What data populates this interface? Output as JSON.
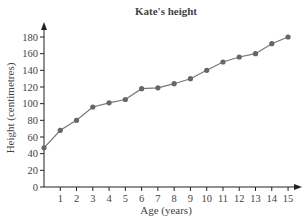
{
  "chart_data": {
    "type": "line",
    "title": "Kate's height",
    "xlabel": "Age (years)",
    "ylabel": "Height (centimetres)",
    "x": [
      0,
      1,
      2,
      3,
      4,
      5,
      6,
      7,
      8,
      9,
      10,
      11,
      12,
      13,
      14,
      15
    ],
    "series": [
      {
        "name": "Kate's height",
        "values": [
          47,
          68,
          80,
          96,
          101,
          105,
          118,
          119,
          124,
          130,
          140,
          150,
          156,
          160,
          172,
          180
        ]
      }
    ],
    "xticks": [
      "1",
      "2",
      "3",
      "4",
      "5",
      "6",
      "7",
      "8",
      "9",
      "10",
      "11",
      "12",
      "13",
      "14",
      "15"
    ],
    "yticks": [
      "0",
      "20",
      "40",
      "60",
      "80",
      "100",
      "120",
      "140",
      "160",
      "180"
    ],
    "xlim": [
      0,
      15.5
    ],
    "ylim": [
      0,
      190
    ],
    "grid": false,
    "legend": null,
    "colors": {
      "line": "#777777",
      "marker": "#666666",
      "axis": "#222222"
    }
  }
}
